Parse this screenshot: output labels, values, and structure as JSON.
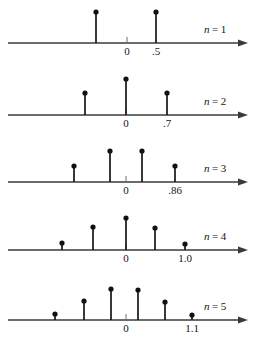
{
  "figure": {
    "axis_color": "#3a3a3a",
    "stem_color": "#161616",
    "dot_color": "#111111",
    "text_color": "#141414",
    "background": "#ffffff"
  },
  "chart_data": {
    "type": "scatter",
    "xlabel": "",
    "ylabel": "",
    "grid": false,
    "legend": "none",
    "panel_label_prefix": "n",
    "panel_label_separator": "=",
    "panels": [
      {
        "label_var": "n",
        "label_eq": "=",
        "label_value": "1",
        "origin_tick": "0",
        "right_tick": ".5",
        "axis_y": 43,
        "axis_x_start": 8,
        "axis_x_end": 248,
        "origin_x": 127,
        "right_tick_x": 156,
        "stems": [
          {
            "x": 96,
            "height": 31
          },
          {
            "x": 156,
            "height": 31
          }
        ]
      },
      {
        "label_var": "n",
        "label_eq": "=",
        "label_value": "2",
        "origin_tick": "0",
        "right_tick": ".7",
        "axis_y": 115,
        "axis_x_start": 8,
        "axis_x_end": 248,
        "origin_x": 126,
        "right_tick_x": 167,
        "stems": [
          {
            "x": 85,
            "height": 22
          },
          {
            "x": 126,
            "height": 36
          },
          {
            "x": 167,
            "height": 22
          }
        ]
      },
      {
        "label_var": "n",
        "label_eq": "=",
        "label_value": "3",
        "origin_tick": "0",
        "right_tick": ".86",
        "axis_y": 182,
        "axis_x_start": 8,
        "axis_x_end": 248,
        "origin_x": 126,
        "right_tick_x": 175,
        "stems": [
          {
            "x": 74,
            "height": 16
          },
          {
            "x": 110,
            "height": 31
          },
          {
            "x": 142,
            "height": 31
          },
          {
            "x": 175,
            "height": 16
          }
        ]
      },
      {
        "label_var": "n",
        "label_eq": "=",
        "label_value": "4",
        "origin_tick": "0",
        "right_tick": "1.0",
        "axis_y": 250,
        "axis_x_start": 8,
        "axis_x_end": 248,
        "origin_x": 126,
        "right_tick_x": 185,
        "stems": [
          {
            "x": 62,
            "height": 7
          },
          {
            "x": 93,
            "height": 23
          },
          {
            "x": 126,
            "height": 32
          },
          {
            "x": 155,
            "height": 22
          },
          {
            "x": 185,
            "height": 6
          }
        ]
      },
      {
        "label_var": "n",
        "label_eq": "=",
        "label_value": "5",
        "origin_tick": "0",
        "right_tick": "1.1",
        "axis_y": 320,
        "axis_x_start": 8,
        "axis_x_end": 248,
        "origin_x": 126,
        "right_tick_x": 192,
        "stems": [
          {
            "x": 55,
            "height": 6
          },
          {
            "x": 84,
            "height": 19
          },
          {
            "x": 111,
            "height": 31
          },
          {
            "x": 138,
            "height": 30
          },
          {
            "x": 165,
            "height": 18
          },
          {
            "x": 192,
            "height": 5
          }
        ]
      }
    ]
  }
}
